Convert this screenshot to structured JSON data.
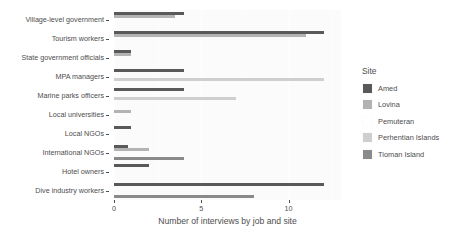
{
  "chart_data": {
    "type": "bar",
    "orientation": "horizontal",
    "title": "",
    "xlabel": "Number of interviews by job and site",
    "ylabel": "",
    "xlim": [
      0,
      13
    ],
    "xticks": [
      0,
      5,
      10
    ],
    "xticklabels": [
      "0",
      "5",
      "10"
    ],
    "grid": true,
    "legend_position": "right",
    "legend_title": "Site",
    "categories": [
      "Village-level government",
      "Tourism workers",
      "State government officials",
      "MPA managers",
      "Marine parks officers",
      "Local universities",
      "Local NGOs",
      "International NGOs",
      "Hotel owners",
      "Dive industry workers"
    ],
    "series": [
      {
        "name": "Amed",
        "color": "#595959",
        "values": [
          4,
          12,
          1,
          4,
          4,
          0,
          1,
          0.8,
          2,
          12
        ]
      },
      {
        "name": "Lovina",
        "color": "#b3b3b3",
        "values": [
          3.5,
          11,
          1,
          0,
          0,
          1,
          0,
          2,
          0,
          0
        ]
      },
      {
        "name": "Pemuteran",
        "color": "#ffffff",
        "values": [
          0,
          0,
          0,
          0,
          0,
          0,
          0,
          0,
          0,
          0
        ]
      },
      {
        "name": "Perhentian Islands",
        "color": "#cfcfcf",
        "values": [
          0,
          0,
          0,
          12,
          7,
          0,
          0,
          0,
          0,
          0
        ]
      },
      {
        "name": "Tioman Island",
        "color": "#8a8a8a",
        "values": [
          0,
          0,
          0,
          0,
          0,
          0,
          0,
          4,
          0,
          8
        ]
      }
    ]
  },
  "legend": {
    "title": "Site",
    "items": [
      {
        "label": "Amed",
        "color": "#595959"
      },
      {
        "label": "Lovina",
        "color": "#b3b3b3"
      },
      {
        "label": "Pemuteran",
        "color": "#ffffff"
      },
      {
        "label": "Perhentian Islands",
        "color": "#cfcfcf"
      },
      {
        "label": "Tioman Island",
        "color": "#8a8a8a"
      }
    ]
  },
  "axis": {
    "x_title": "Number of interviews by job and site",
    "x_tick_labels": [
      "0",
      "5",
      "10"
    ],
    "y_tick_labels": [
      "Village-level government",
      "Tourism workers",
      "State government officials",
      "MPA managers",
      "Marine parks officers",
      "Local universities",
      "Local NGOs",
      "International NGOs",
      "Hotel owners",
      "Dive industry workers"
    ]
  },
  "theme": {
    "panel_background": "#fbfbfb",
    "grid_color": "#ffffff",
    "text_color": "#4d4d4d",
    "page_background": "#ffffff"
  }
}
